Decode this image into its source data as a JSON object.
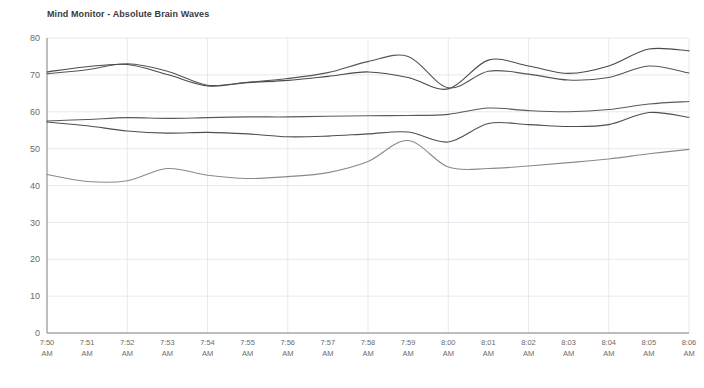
{
  "chart_data": {
    "type": "line",
    "title": "Mind Monitor - Absolute Brain Waves",
    "xlabel": "",
    "ylabel": "",
    "ylim": [
      0,
      80
    ],
    "yticks": [
      0,
      10,
      20,
      30,
      40,
      50,
      60,
      70,
      80
    ],
    "grid": true,
    "legend": "none",
    "x": [
      "7:50 AM",
      "7:51 AM",
      "7:52 AM",
      "7:53 AM",
      "7:54 AM",
      "7:55 AM",
      "7:56 AM",
      "7:57 AM",
      "7:58 AM",
      "7:59 AM",
      "8:00 AM",
      "8:01 AM",
      "8:02 AM",
      "8:03 AM",
      "8:04 AM",
      "8:05 AM",
      "8:06 AM"
    ],
    "xtick_labels_line1": [
      "7:50",
      "7:51",
      "7:52",
      "7:53",
      "7:54",
      "7:55",
      "7:56",
      "7:57",
      "7:58",
      "7:59",
      "8:00",
      "8:01",
      "8:02",
      "8:03",
      "8:04",
      "8:05",
      "8:06"
    ],
    "xtick_labels_line2": [
      "AM",
      "AM",
      "AM",
      "AM",
      "AM",
      "AM",
      "AM",
      "AM",
      "AM",
      "AM",
      "AM",
      "AM",
      "AM",
      "AM",
      "AM",
      "AM",
      "AM"
    ],
    "series": [
      {
        "name": "Delta",
        "color": "#555555",
        "values": [
          70.3,
          71.4,
          73.0,
          71.0,
          67.2,
          68.0,
          69.0,
          70.6,
          73.6,
          75.0,
          66.5,
          71.0,
          70.2,
          68.6,
          69.3,
          72.4,
          70.5
        ]
      },
      {
        "name": "Theta",
        "color": "#4a4a4a",
        "values": [
          70.8,
          72.2,
          72.8,
          70.1,
          67.0,
          67.9,
          68.5,
          69.6,
          70.8,
          69.3,
          66.2,
          74.0,
          72.4,
          70.4,
          72.4,
          77.0,
          76.5
        ]
      },
      {
        "name": "Alpha",
        "color": "#5a5a5a",
        "values": [
          57.5,
          57.9,
          58.4,
          58.2,
          58.4,
          58.6,
          58.6,
          58.8,
          58.9,
          59.0,
          59.3,
          61.0,
          60.3,
          60.0,
          60.6,
          62.1,
          62.8
        ]
      },
      {
        "name": "Beta",
        "color": "#4f4f4f",
        "values": [
          57.2,
          56.2,
          54.8,
          54.2,
          54.4,
          54.0,
          53.2,
          53.4,
          54.0,
          54.5,
          51.8,
          56.8,
          56.5,
          56.0,
          56.5,
          59.8,
          58.5
        ]
      },
      {
        "name": "Gamma",
        "color": "#8a8a8a",
        "values": [
          43.0,
          41.1,
          41.3,
          44.6,
          42.8,
          41.9,
          42.4,
          43.5,
          46.5,
          52.2,
          45.0,
          44.6,
          45.3,
          46.2,
          47.2,
          48.6,
          49.8
        ]
      }
    ]
  },
  "axes": {
    "axis_color": "#888888",
    "grid_color": "#e8e8ef",
    "tick_text_color": "#6b6b6b"
  }
}
